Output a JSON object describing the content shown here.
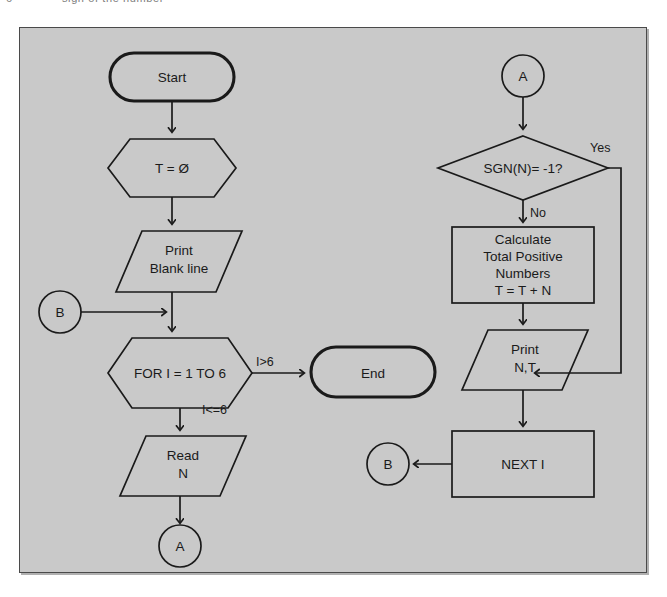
{
  "page": {
    "folio": "6",
    "running_caption": "sign of the number",
    "panel_fill": "#c9c9c9",
    "panel_border": "#4a4a4a",
    "ink": "#1a1a1a"
  },
  "flowchart": {
    "type": "flowchart",
    "title": "",
    "left_column": {
      "start": {
        "shape": "terminator",
        "text": "Start"
      },
      "init": {
        "shape": "preparation-hexagon",
        "text": "T = Ø"
      },
      "print_blank": {
        "shape": "input-output-parallelogram",
        "line1": "Print",
        "line2": "Blank line"
      },
      "connector_b_in": {
        "shape": "connector-circle",
        "text": "B"
      },
      "for_loop": {
        "shape": "preparation-hexagon",
        "text": "FOR I = 1 TO 6"
      },
      "end": {
        "shape": "terminator",
        "text": "End"
      },
      "read_n": {
        "shape": "input-output-parallelogram",
        "line1": "Read",
        "line2": "N"
      },
      "connector_a_out": {
        "shape": "connector-circle",
        "text": "A"
      }
    },
    "right_column": {
      "connector_a_in": {
        "shape": "connector-circle",
        "text": "A"
      },
      "decision": {
        "shape": "decision-diamond",
        "text": "SGN(N)= -1?"
      },
      "calculate": {
        "shape": "process-box",
        "line1": "Calculate",
        "line2": "Total Positive",
        "line3": "Numbers",
        "line4": "T = T + N"
      },
      "print_nt": {
        "shape": "input-output-parallelogram",
        "line1": "Print",
        "line2": "N,T"
      },
      "next_i": {
        "shape": "process-box",
        "text": "NEXT I"
      },
      "connector_b_out": {
        "shape": "connector-circle",
        "text": "B"
      }
    },
    "edge_labels": {
      "loop_exit": "I>6",
      "loop_continue": "I<=6",
      "decision_yes": "Yes",
      "decision_no": "No"
    }
  }
}
